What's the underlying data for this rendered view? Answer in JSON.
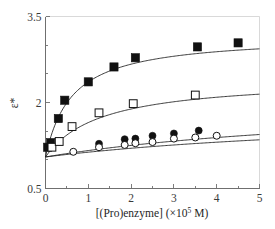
{
  "chart_data": {
    "type": "scatter",
    "title": "",
    "subtitle": "",
    "xlabel": "[(Pro)enzyme] (×10⁵ M)",
    "xlabel_base": "[(Pro)enzyme] (×10",
    "xlabel_exponent": "5",
    "xlabel_tail": " M)",
    "ylabel": "ε*",
    "xlim": [
      0,
      5
    ],
    "ylim": [
      0.5,
      3.5
    ],
    "x_ticks": [
      0,
      1,
      2,
      3,
      4,
      5
    ],
    "x_tick_labels": [
      "0",
      "1",
      "2",
      "3",
      "4",
      "5"
    ],
    "x_minor_ticks": [
      0.5,
      1.5,
      2.5,
      3.5,
      4.5
    ],
    "y_ticks": [
      0.5,
      2.0,
      3.5
    ],
    "y_tick_labels": [
      "0.5",
      "2",
      "3.5"
    ],
    "y_minor_ticks": [
      1.0,
      1.5,
      2.5,
      3.0
    ],
    "grid": false,
    "legend": null,
    "legend_position": "none",
    "marker_colors": {
      "filled": "#111111",
      "open_fill": "#ffffff",
      "outline": "#111111",
      "curve": "#1a1a1a",
      "axis": "#6f6f6f"
    },
    "series": [
      {
        "name": "filled-squares",
        "marker": "filled-square",
        "points": [
          {
            "x": 0.05,
            "y": 1.22
          },
          {
            "x": 0.12,
            "y": 1.3
          },
          {
            "x": 0.3,
            "y": 1.72
          },
          {
            "x": 0.45,
            "y": 2.04
          },
          {
            "x": 1.0,
            "y": 2.36
          },
          {
            "x": 1.6,
            "y": 2.62
          },
          {
            "x": 2.1,
            "y": 2.78
          },
          {
            "x": 3.55,
            "y": 2.97
          },
          {
            "x": 4.5,
            "y": 3.04
          }
        ],
        "fit": {
          "e0": 1.05,
          "emax": 2.12,
          "kd": 0.62
        }
      },
      {
        "name": "open-squares",
        "marker": "open-square",
        "points": [
          {
            "x": 0.15,
            "y": 1.22
          },
          {
            "x": 0.32,
            "y": 1.32
          },
          {
            "x": 0.62,
            "y": 1.58
          },
          {
            "x": 1.25,
            "y": 1.82
          },
          {
            "x": 2.05,
            "y": 1.98
          },
          {
            "x": 3.5,
            "y": 2.13
          }
        ],
        "fit": {
          "e0": 1.05,
          "emax": 1.38,
          "kd": 1.3
        }
      },
      {
        "name": "filled-circles",
        "marker": "filled-circle",
        "points": [
          {
            "x": 1.25,
            "y": 1.28
          },
          {
            "x": 1.85,
            "y": 1.36
          },
          {
            "x": 2.1,
            "y": 1.37
          },
          {
            "x": 2.5,
            "y": 1.42
          },
          {
            "x": 3.0,
            "y": 1.46
          },
          {
            "x": 3.58,
            "y": 1.51
          }
        ],
        "fit": {
          "e0": 1.05,
          "emax": 1.05,
          "kd": 8.4
        }
      },
      {
        "name": "open-circles",
        "marker": "open-circle",
        "points": [
          {
            "x": 0.65,
            "y": 1.14
          },
          {
            "x": 1.25,
            "y": 1.22
          },
          {
            "x": 1.85,
            "y": 1.26
          },
          {
            "x": 2.1,
            "y": 1.29
          },
          {
            "x": 2.5,
            "y": 1.31
          },
          {
            "x": 3.0,
            "y": 1.37
          },
          {
            "x": 3.5,
            "y": 1.39
          },
          {
            "x": 4.0,
            "y": 1.42
          }
        ],
        "fit": {
          "e0": 1.05,
          "emax": 0.85,
          "kd": 9.2
        }
      }
    ]
  }
}
